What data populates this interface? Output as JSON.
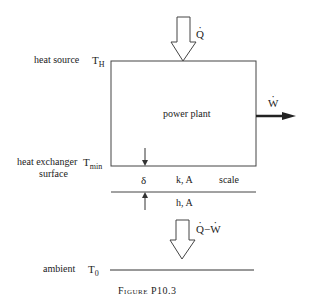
{
  "diagram": {
    "labels": {
      "heat_source": "heat source",
      "heat_exchanger_line1": "heat exchanger",
      "heat_exchanger_line2": "surface",
      "ambient": "ambient",
      "power_plant": "power plant",
      "delta": "δ",
      "k_A": "k, A",
      "scale": "scale",
      "h_A": "h, A"
    },
    "temperatures": {
      "T_H": {
        "base": "T",
        "sub": "H"
      },
      "T_min": {
        "base": "T",
        "sub": "min"
      },
      "T_0": {
        "base": "T",
        "sub": "0"
      }
    },
    "flows": {
      "Q_in": "Q",
      "W_out": "W",
      "Q_out_Q": "Q",
      "Q_out_minus": "−",
      "Q_out_W": "W"
    },
    "caption": "Figure P10.3",
    "colors": {
      "line": "#333333",
      "text": "#222222"
    }
  }
}
